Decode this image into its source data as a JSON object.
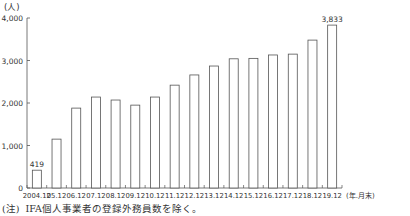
{
  "chart_data": {
    "type": "bar",
    "title": "",
    "unit_label": "(人)",
    "xlabel": "(年.月末)",
    "ylabel": "(人)",
    "ylim": [
      0,
      4000
    ],
    "yticks": [
      0,
      1000,
      2000,
      3000,
      4000
    ],
    "ytick_labels": [
      "0",
      "1,000",
      "2,000",
      "3,000",
      "4,000"
    ],
    "grid": false,
    "legend": null,
    "categories": [
      "2004.12",
      "05.12",
      "06.12",
      "07.12",
      "08.12",
      "09.12",
      "10.12",
      "11.12",
      "12.12",
      "13.12",
      "14.12",
      "15.12",
      "16.12",
      "17.12",
      "18.12",
      "19.12"
    ],
    "values": [
      419,
      1150,
      1880,
      2140,
      2070,
      1950,
      2140,
      2420,
      2660,
      2870,
      3040,
      3050,
      3130,
      3150,
      3480,
      3833
    ],
    "data_labels": [
      {
        "index": 0,
        "text": "419"
      },
      {
        "index": 15,
        "text": "3,833"
      }
    ],
    "bar_style": {
      "fill": "#ffffff",
      "stroke": "#555555"
    }
  },
  "footnote": {
    "tag": "(注)",
    "text": "IFA個人事業者の登録外務員数を除く。"
  }
}
